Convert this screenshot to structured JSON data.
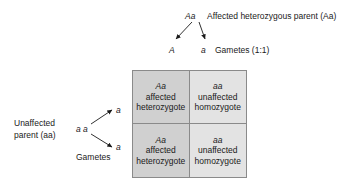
{
  "diagram": {
    "top_parent": {
      "genotype": "Aa",
      "description": "Affected heterozygous parent (Aa)"
    },
    "top_gametes": {
      "allele_left": "A",
      "allele_right": "a",
      "label": "Gametes (1:1)"
    },
    "left_parent": {
      "line1": "Unaffected",
      "line2": "parent (aa)",
      "genotype": "a a",
      "gamete_top": "a",
      "gamete_bottom": "a",
      "label": "Gametes"
    },
    "punnett": {
      "cells": [
        {
          "genotype": "Aa",
          "line1": "affected",
          "line2": "heterozygote",
          "shade": "dark"
        },
        {
          "genotype": "aa",
          "line1": "unaffected",
          "line2": "homozygote",
          "shade": "light"
        },
        {
          "genotype": "Aa",
          "line1": "affected",
          "line2": "heterozygote",
          "shade": "dark"
        },
        {
          "genotype": "aa",
          "line1": "unaffected",
          "line2": "homozygote",
          "shade": "light"
        }
      ]
    },
    "colors": {
      "cell_dark": "#d0d0d0",
      "cell_light": "#e3e3e3",
      "border": "#8a8a8a",
      "text": "#1a1a1a",
      "background": "#ffffff"
    }
  }
}
